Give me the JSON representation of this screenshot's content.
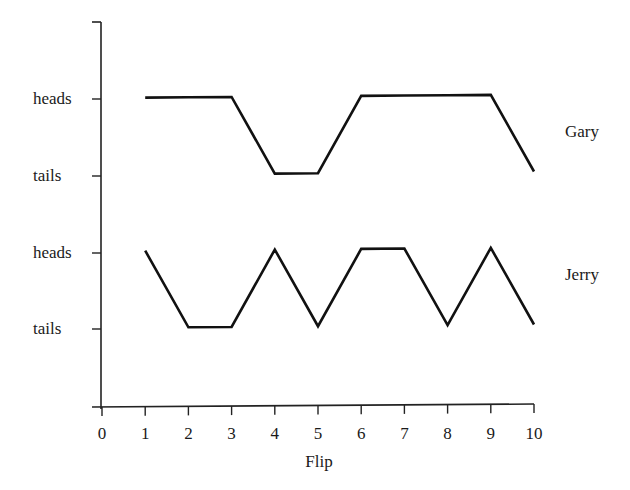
{
  "chart_data": {
    "type": "line",
    "title": "",
    "xlabel": "Flip",
    "ylabel": "",
    "x": [
      1,
      2,
      3,
      4,
      5,
      6,
      7,
      8,
      9,
      10
    ],
    "xticks": [
      "0",
      "1",
      "2",
      "3",
      "4",
      "5",
      "6",
      "7",
      "8",
      "9",
      "10"
    ],
    "xlim": [
      0,
      10
    ],
    "grid": false,
    "legend_position": "right (inline series labels)",
    "series": [
      {
        "name": "Gary",
        "y_labels": [
          "heads",
          "tails"
        ],
        "values": [
          "heads",
          "heads",
          "heads",
          "tails",
          "tails",
          "heads",
          "heads",
          "heads",
          "heads",
          "tails"
        ]
      },
      {
        "name": "Jerry",
        "y_labels": [
          "heads",
          "tails"
        ],
        "values": [
          "heads",
          "tails",
          "tails",
          "heads",
          "tails",
          "heads",
          "heads",
          "tails",
          "heads",
          "tails"
        ]
      }
    ],
    "ytick_labels": [
      "heads",
      "tails",
      "heads",
      "tails"
    ]
  },
  "labels": {
    "xlabel": "Flip",
    "gary": "Gary",
    "jerry": "Jerry",
    "heads": "heads",
    "tails": "tails"
  }
}
